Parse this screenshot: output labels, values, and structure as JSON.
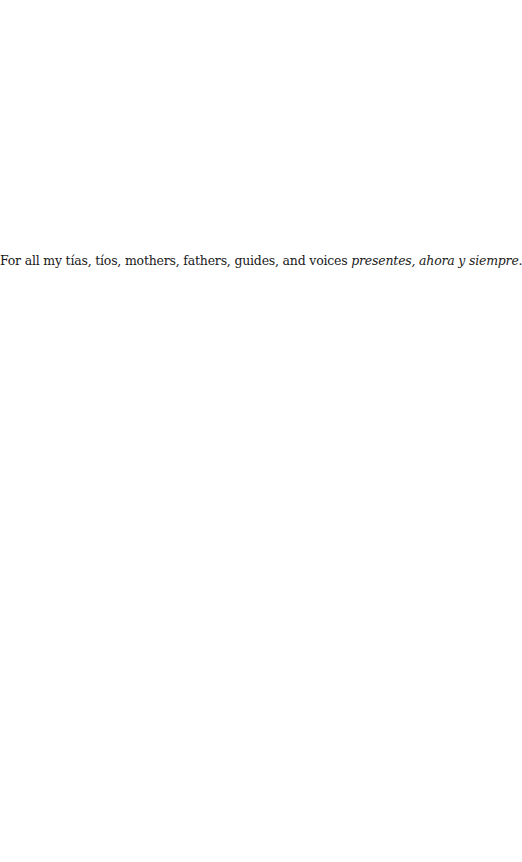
{
  "dedication": {
    "text_plain": "For all my tías, tíos, mothers, fathers, guides, and voices ",
    "text_italic": "presentes, ahora y siempre",
    "text_end": "."
  }
}
